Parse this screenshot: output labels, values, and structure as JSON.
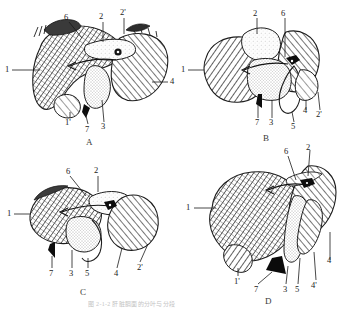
{
  "figure": {
    "title_caption": "图 2-1-2  肝脏膈面的分叶与分段",
    "kind": "anatomical-line-drawing",
    "background_color": "#ffffff",
    "ink_color": "#1a1a1a",
    "panels": [
      {
        "letter": "A",
        "labels": [
          "1",
          "6",
          "2",
          "2'",
          "4",
          "1'",
          "7",
          "3"
        ]
      },
      {
        "letter": "B",
        "labels": [
          "2",
          "6",
          "1",
          "7",
          "3",
          "5",
          "4",
          "2'"
        ]
      },
      {
        "letter": "C",
        "labels": [
          "6",
          "2",
          "1",
          "7",
          "3",
          "5",
          "4",
          "2'"
        ]
      },
      {
        "letter": "D",
        "labels": [
          "6",
          "2",
          "1",
          "1'",
          "7",
          "3",
          "5",
          "4'",
          "4"
        ]
      }
    ]
  },
  "panelA": {
    "letter": "A",
    "l1": "1",
    "l6": "6",
    "l2": "2",
    "l2p": "2'",
    "l4": "4",
    "l1p": "1'",
    "l7": "7",
    "l3": "3"
  },
  "panelB": {
    "letter": "B",
    "l2": "2",
    "l6": "6",
    "l1": "1",
    "l7": "7",
    "l3": "3",
    "l5": "5",
    "l4": "4",
    "l2p": "2'"
  },
  "panelC": {
    "letter": "C",
    "l6": "6",
    "l2": "2",
    "l1": "1",
    "l7": "7",
    "l3": "3",
    "l5": "5",
    "l4": "4",
    "l2p": "2'"
  },
  "panelD": {
    "letter": "D",
    "l6": "6",
    "l2": "2",
    "l1": "1",
    "l1p": "1'",
    "l7": "7",
    "l3": "3",
    "l5": "5",
    "l4p": "4'",
    "l4": "4"
  },
  "caption": {
    "text": "图 2-1-2   肝脏膈面的分叶与分段"
  }
}
